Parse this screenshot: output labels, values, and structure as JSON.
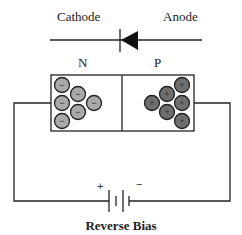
{
  "diagram": {
    "title": "Reverse Bias",
    "terminals": {
      "cathode": "Cathode",
      "anode": "Anode"
    },
    "regions": [
      {
        "label": "N",
        "carrier": "electron",
        "carrier_symbol": "−",
        "carrier_color": "#a9a9a9",
        "count": 6
      },
      {
        "label": "P",
        "carrier": "hole",
        "carrier_symbol": "+",
        "carrier_color": "#6e6e6e",
        "count": 6
      }
    ],
    "battery": {
      "positive": "+",
      "negative": "−"
    },
    "colors": {
      "line": "#222222",
      "background": "#ffffff"
    }
  }
}
